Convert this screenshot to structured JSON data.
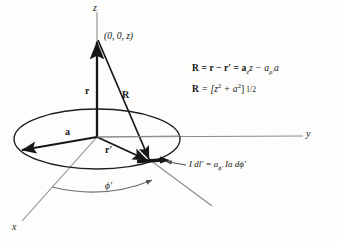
{
  "figure": {
    "background_color": "#fdfdfb",
    "ink_color": "#161616",
    "thin_line_color": "#6e6e6e"
  },
  "axes": {
    "z_label": "z",
    "y_label": "y",
    "x_label": "x"
  },
  "points": {
    "field_point_label": "(0, 0, z)"
  },
  "vectors": {
    "r_label": "r",
    "r_prime_label": "r′",
    "R_label": "R",
    "radius_label": "a"
  },
  "angle": {
    "phi_prime_label": "ϕ′"
  },
  "element": {
    "text_prefix": "I dl′ = a",
    "text_sub1": "ϕ′",
    "text_mid": " Ia d",
    "text_suffix": "ϕ′"
  },
  "equations": {
    "eq1": {
      "lhs": "R",
      "eq1": " = r − r′ = a",
      "sub1": "z",
      "mid": "z − a",
      "sub2": "ρ′",
      "tail": "a"
    },
    "eq2": {
      "lhs": "R",
      "body": " = [z",
      "sup1": "2",
      "plus": " + a",
      "sup2": "2",
      "close": "]",
      "exp": "1/2"
    }
  }
}
